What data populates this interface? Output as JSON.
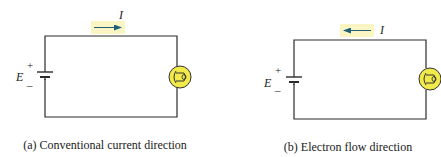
{
  "colors": {
    "wire": "#2b2b2b",
    "arrow": "#1f5f7a",
    "highlight": "#fbf5c4",
    "lamp_fill": "#f2ea4a",
    "lamp_stroke": "#333333",
    "text": "#222222"
  },
  "panels": [
    {
      "id": "a",
      "current_label": "I",
      "arrow_direction": "right",
      "source_label": "E",
      "plus_sign": "+",
      "minus_sign": "–",
      "caption": "(a) Conventional current direction"
    },
    {
      "id": "b",
      "current_label": "I",
      "arrow_direction": "left",
      "source_label": "E",
      "plus_sign": "+",
      "minus_sign": "–",
      "caption": "(b) Electron flow direction"
    }
  ]
}
